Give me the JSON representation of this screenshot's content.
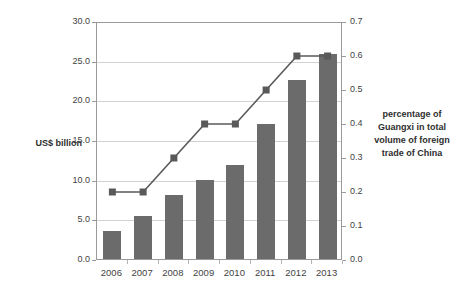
{
  "chart_data": {
    "type": "bar",
    "title": "",
    "subtitle": "",
    "categories": [
      "2006",
      "2007",
      "2008",
      "2009",
      "2010",
      "2011",
      "2012",
      "2013"
    ],
    "xlabel": "",
    "grid": true,
    "legend": "none",
    "series": [
      {
        "name": "US$ billion",
        "type": "bar",
        "axis": "left",
        "color": "#6b6b6b",
        "values": [
          3.5,
          5.4,
          8.1,
          9.9,
          11.8,
          17.0,
          22.6,
          25.9
        ]
      },
      {
        "name": "percentage of Guangxi in total volume of foreign trade of China",
        "type": "line",
        "axis": "right",
        "color": "#595959",
        "marker": "square",
        "values": [
          0.2,
          0.2,
          0.3,
          0.4,
          0.4,
          0.5,
          0.6,
          0.6
        ]
      }
    ],
    "left_axis": {
      "label": "US$ billion",
      "ylim": [
        0.0,
        30.0
      ],
      "tick_step": 5.0,
      "ticks": [
        "0.0",
        "5.0",
        "10.0",
        "15.0",
        "20.0",
        "25.0",
        "30.0"
      ],
      "tick_values": [
        0.0,
        5.0,
        10.0,
        15.0,
        20.0,
        25.0,
        30.0
      ]
    },
    "right_axis": {
      "label": "percentage of Guangxi in total volume of foreign trade of China",
      "ylim": [
        0.0,
        0.7
      ],
      "tick_step": 0.1,
      "ticks": [
        "0.0",
        "0.1",
        "0.2",
        "0.3",
        "0.4",
        "0.5",
        "0.6",
        "0.7"
      ],
      "tick_values": [
        0.0,
        0.1,
        0.2,
        0.3,
        0.4,
        0.5,
        0.6,
        0.7
      ]
    }
  },
  "labels": {
    "left_axis_title": "US$ billion",
    "right_axis_title_lines": [
      "percentage of",
      "Guangxi in total",
      "volume of foreign",
      "trade of China"
    ]
  },
  "colors": {
    "bar": "#6b6b6b",
    "line": "#595959",
    "grid": "#d2d2d2",
    "axis": "#9a9a9a",
    "text": "#3f3f3f",
    "background": "#ffffff"
  }
}
